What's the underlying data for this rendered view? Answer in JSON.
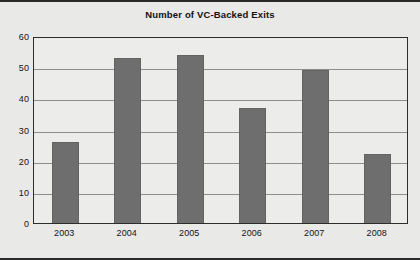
{
  "chart_data": {
    "type": "bar",
    "title": "Number of VC-Backed Exits",
    "xlabel": "",
    "ylabel": "",
    "categories": [
      "2003",
      "2004",
      "2005",
      "2006",
      "2007",
      "2008"
    ],
    "values": [
      26,
      53,
      54,
      37,
      49,
      22
    ],
    "ylim": [
      0,
      60
    ],
    "yticks": [
      0,
      10,
      20,
      30,
      40,
      50,
      60
    ],
    "ytick_labels": [
      "0",
      "10",
      "20",
      "30",
      "40",
      "50",
      "60"
    ],
    "grid": true,
    "grid_axis": "y",
    "legend": false,
    "legend_position": "none",
    "series": [
      {
        "name": "Number of VC-Backed Exits",
        "values": [
          26,
          53,
          54,
          37,
          49,
          22
        ]
      }
    ],
    "colors": {
      "bar_fill": "#6e6e6e",
      "bar_edge": "#636363",
      "plot_background": "#ececea",
      "figure_background": "#e9e9e7",
      "gridline": "#8d8d8d",
      "axis_frame": "#2d2d2d",
      "text": "#141414",
      "title_text": "#111111"
    }
  }
}
